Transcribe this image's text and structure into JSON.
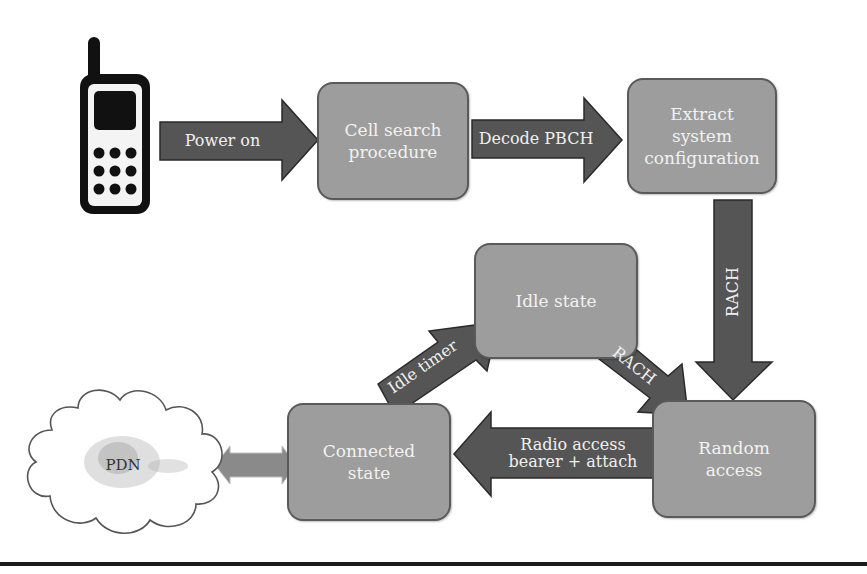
{
  "diagram": {
    "type": "flow",
    "nodes": {
      "phone": {
        "label": "",
        "icon": "mobile-phone-icon"
      },
      "cell_search": {
        "label": "Cell search procedure",
        "lines": [
          "Cell search",
          "procedure"
        ]
      },
      "extract": {
        "label": "Extract system configuration",
        "lines": [
          "Extract",
          "system",
          "configuration"
        ]
      },
      "idle": {
        "label": "Idle state"
      },
      "random_access": {
        "label": "Random access",
        "lines": [
          "Random",
          "access"
        ]
      },
      "connected": {
        "label": "Connected state",
        "lines": [
          "Connected",
          "state"
        ]
      },
      "pdn": {
        "label": "PDN",
        "icon": "cloud-icon"
      }
    },
    "edges": {
      "power_on": {
        "from": "phone",
        "to": "cell_search",
        "label": "Power on"
      },
      "decode_pbch": {
        "from": "cell_search",
        "to": "extract",
        "label": "Decode PBCH"
      },
      "rach_down": {
        "from": "extract",
        "to": "random_access",
        "label": "RACH"
      },
      "rach_idle": {
        "from": "idle",
        "to": "random_access",
        "label": "RACH"
      },
      "idle_timer": {
        "from": "connected",
        "to": "idle",
        "label": "Idle timer"
      },
      "radio_access": {
        "from": "random_access",
        "to": "connected",
        "label": "Radio access bearer + attach",
        "lines": [
          "Radio access",
          "bearer + attach"
        ]
      },
      "pdn_link": {
        "from": "connected",
        "to": "pdn",
        "label": "",
        "bidirectional": true
      }
    },
    "colors": {
      "box_fill": "#9d9d9d",
      "box_border": "#5a5a5a",
      "arrow_fill": "#555555",
      "arrow_border": "#2a2a2a",
      "text": "#f2f2f2",
      "pdn_arrow": "#8a8a8a"
    }
  }
}
